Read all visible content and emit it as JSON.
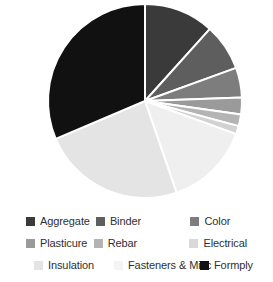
{
  "chart_data": {
    "type": "pie",
    "title": "",
    "legend_position": "bottom",
    "grid": false,
    "categories": [
      "Aggregate",
      "Binder",
      "Color",
      "Plasticure",
      "Rebar",
      "Electrical",
      "Insulation",
      "Fasteners & Misc",
      "Formply"
    ],
    "values": [
      11.7,
      7.8,
      5.0,
      2.8,
      1.9,
      1.4,
      23.9,
      14.2,
      28.3
    ],
    "units": "percent",
    "colors": [
      "#3a3a3a",
      "#5e5e5e",
      "#7d7d7d",
      "#9a9a9a",
      "#b4b4b4",
      "#d2d2d2",
      "#e4e4e4",
      "#efefef",
      "#111111"
    ],
    "slice_order_clockwise_from_top": [
      "Aggregate",
      "Binder",
      "Color",
      "Plasticure",
      "Rebar",
      "Electrical",
      "Fasteners & Misc",
      "Insulation",
      "Formply"
    ],
    "slice_angles_deg": [
      {
        "name": "Aggregate",
        "start": 0,
        "end": 42
      },
      {
        "name": "Binder",
        "start": 42,
        "end": 70
      },
      {
        "name": "Color",
        "start": 70,
        "end": 88
      },
      {
        "name": "Plasticure",
        "start": 88,
        "end": 98
      },
      {
        "name": "Rebar",
        "start": 98,
        "end": 105
      },
      {
        "name": "Electrical",
        "start": 105,
        "end": 110
      },
      {
        "name": "Fasteners & Misc",
        "start": 110,
        "end": 161
      },
      {
        "name": "Insulation",
        "start": 161,
        "end": 247
      },
      {
        "name": "Formply",
        "start": 247,
        "end": 360
      }
    ],
    "geometry": {
      "cx": 145,
      "cy": 101,
      "r": 97,
      "separator_color": "#ffffff",
      "separator_width": 2
    }
  },
  "legend": {
    "rows": [
      [
        {
          "label": "Aggregate",
          "color": "#3a3a3a"
        },
        {
          "label": "Binder",
          "color": "#5e5e5e"
        },
        {
          "label": "Color",
          "color": "#7d7d7d"
        }
      ],
      [
        {
          "label": "Plasticure",
          "color": "#9a9a9a"
        },
        {
          "label": "Rebar",
          "color": "#b4b4b4"
        },
        {
          "label": "Electrical",
          "color": "#d9d9d9"
        }
      ],
      [
        {
          "label": "Insulation",
          "color": "#e4e4e4"
        },
        {
          "label": "Fasteners & Misc",
          "color": "#f4f4f4"
        },
        {
          "label": "Formply",
          "color": "#111111"
        }
      ]
    ]
  }
}
